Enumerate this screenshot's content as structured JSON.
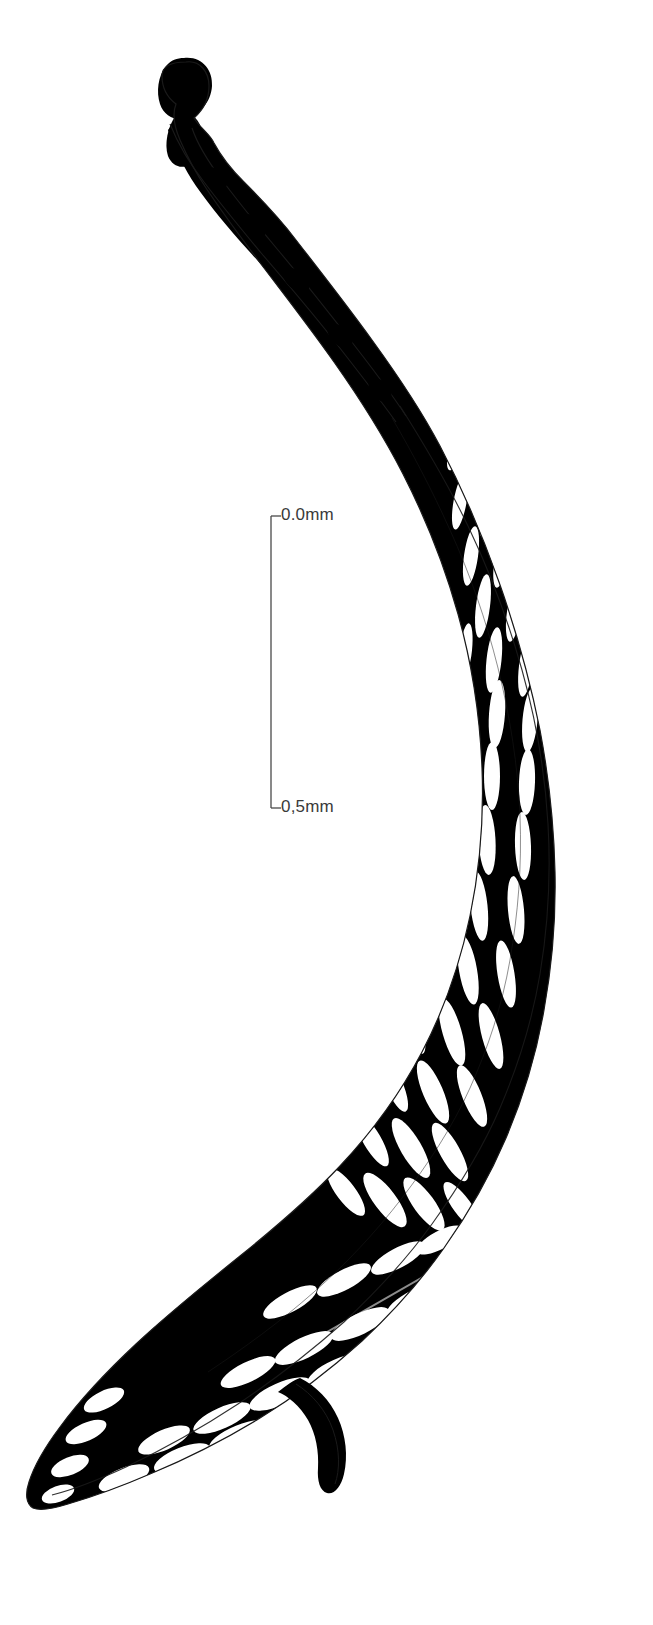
{
  "figure": {
    "domain": "scientific-line-illustration",
    "title": "",
    "caption": "",
    "background_color": "#ffffff",
    "ink_color": "#000000",
    "outline_color": "#1a1a1a",
    "canvas": {
      "width": 653,
      "height": 1625
    }
  },
  "scale_bar": {
    "name": "scale-bar",
    "orientation": "vertical",
    "label_color": "#3a3a3a",
    "top_label": "0.0mm",
    "bottom_label": "0,5mm",
    "unit": "mm",
    "span_value": 0.5,
    "line_x": 271,
    "top_y": 516,
    "bottom_y": 808,
    "tick_length": 10
  },
  "specimen": {
    "name": "reticulate-specimen",
    "description": "Elongate curved specimen with knobbed apex, narrow sinuous stalk and broad reticulate net-like body",
    "parts": [
      {
        "name": "apex-knob",
        "label": "apex knob"
      },
      {
        "name": "stalk",
        "label": "stalk"
      },
      {
        "name": "reticulate-body",
        "label": "reticulate body"
      },
      {
        "name": "lateral-spur",
        "label": "lateral spur"
      },
      {
        "name": "outline-contour",
        "label": "outline contour"
      }
    ]
  }
}
